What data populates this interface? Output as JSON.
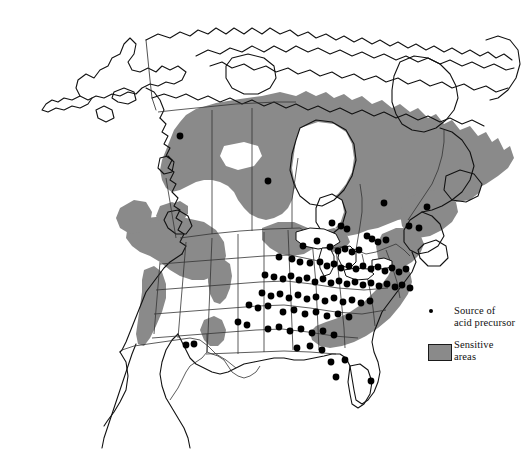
{
  "figure": {
    "width": 526,
    "height": 450,
    "background_color": "#ffffff"
  },
  "colors": {
    "sensitive_area_fill": "#8a8a8a",
    "land_fill": "#ffffff",
    "coastline_stroke": "#111111",
    "border_stroke": "#333333",
    "dot_fill": "#000000"
  },
  "legend": {
    "entries": [
      {
        "marker": "source-dot",
        "label": "Source of\nacid precursor"
      },
      {
        "marker": "sensitive-swatch",
        "label": "Sensitive\nareas"
      }
    ]
  },
  "map_data": {
    "type": "thematic-point-and-area-map",
    "region": "North America",
    "point_series": {
      "name": "Source of acid precursor",
      "symbol": "filled-circle",
      "radius_px": 3.4,
      "count": 96,
      "points": [
        [
          180,
          136
        ],
        [
          268,
          181
        ],
        [
          384,
          203
        ],
        [
          427,
          207
        ],
        [
          409,
          226
        ],
        [
          419,
          228
        ],
        [
          367,
          236
        ],
        [
          372,
          239
        ],
        [
          378,
          242
        ],
        [
          386,
          240
        ],
        [
          332,
          223
        ],
        [
          341,
          226
        ],
        [
          347,
          229
        ],
        [
          303,
          246
        ],
        [
          317,
          241
        ],
        [
          330,
          247
        ],
        [
          338,
          251
        ],
        [
          345,
          249
        ],
        [
          352,
          252
        ],
        [
          359,
          250
        ],
        [
          279,
          257
        ],
        [
          292,
          259
        ],
        [
          300,
          262
        ],
        [
          310,
          263
        ],
        [
          320,
          262
        ],
        [
          327,
          266
        ],
        [
          334,
          264
        ],
        [
          341,
          268
        ],
        [
          349,
          266
        ],
        [
          356,
          269
        ],
        [
          363,
          266
        ],
        [
          371,
          269
        ],
        [
          378,
          267
        ],
        [
          385,
          271
        ],
        [
          392,
          268
        ],
        [
          399,
          272
        ],
        [
          406,
          269
        ],
        [
          265,
          275
        ],
        [
          274,
          277
        ],
        [
          283,
          279
        ],
        [
          291,
          276
        ],
        [
          299,
          280
        ],
        [
          307,
          278
        ],
        [
          315,
          282
        ],
        [
          323,
          279
        ],
        [
          331,
          283
        ],
        [
          339,
          281
        ],
        [
          347,
          284
        ],
        [
          355,
          282
        ],
        [
          363,
          285
        ],
        [
          371,
          283
        ],
        [
          379,
          286
        ],
        [
          387,
          284
        ],
        [
          395,
          287
        ],
        [
          402,
          285
        ],
        [
          410,
          288
        ],
        [
          262,
          293
        ],
        [
          271,
          296
        ],
        [
          280,
          294
        ],
        [
          289,
          298
        ],
        [
          298,
          295
        ],
        [
          307,
          299
        ],
        [
          316,
          297
        ],
        [
          325,
          301
        ],
        [
          334,
          298
        ],
        [
          343,
          302
        ],
        [
          352,
          300
        ],
        [
          361,
          303
        ],
        [
          370,
          301
        ],
        [
          249,
          305
        ],
        [
          258,
          308
        ],
        [
          268,
          306
        ],
        [
          283,
          312
        ],
        [
          294,
          310
        ],
        [
          305,
          314
        ],
        [
          316,
          312
        ],
        [
          327,
          316
        ],
        [
          338,
          314
        ],
        [
          349,
          317
        ],
        [
          238,
          322
        ],
        [
          247,
          325
        ],
        [
          268,
          329
        ],
        [
          279,
          327
        ],
        [
          290,
          331
        ],
        [
          301,
          329
        ],
        [
          312,
          333
        ],
        [
          323,
          331
        ],
        [
          334,
          335
        ],
        [
          186,
          345
        ],
        [
          194,
          344
        ],
        [
          297,
          348
        ],
        [
          310,
          346
        ],
        [
          322,
          350
        ],
        [
          331,
          362
        ],
        [
          345,
          360
        ],
        [
          336,
          377
        ],
        [
          371,
          381
        ]
      ]
    },
    "area_series": {
      "name": "Sensitive areas",
      "fill": "#8a8a8a",
      "regions": [
        "Canadian Shield (northern Saskatchewan, Manitoba, Ontario, Quebec, Labrador)",
        "Atlantic Canada / Maritimes",
        "Adirondacks and New England uplands",
        "Appalachian Mountains (Pennsylvania to Georgia)",
        "Upper Great Lakes (northern Minnesota, Wisconsin, Michigan)",
        "Pacific Northwest (Washington, Oregon, Idaho, western Montana)",
        "Sierra Nevada (California)",
        "Central Rocky Mountains (Colorado)",
        "Southern Rockies / New Mexico",
        "Northwest British Columbia coastal ranges"
      ]
    }
  }
}
